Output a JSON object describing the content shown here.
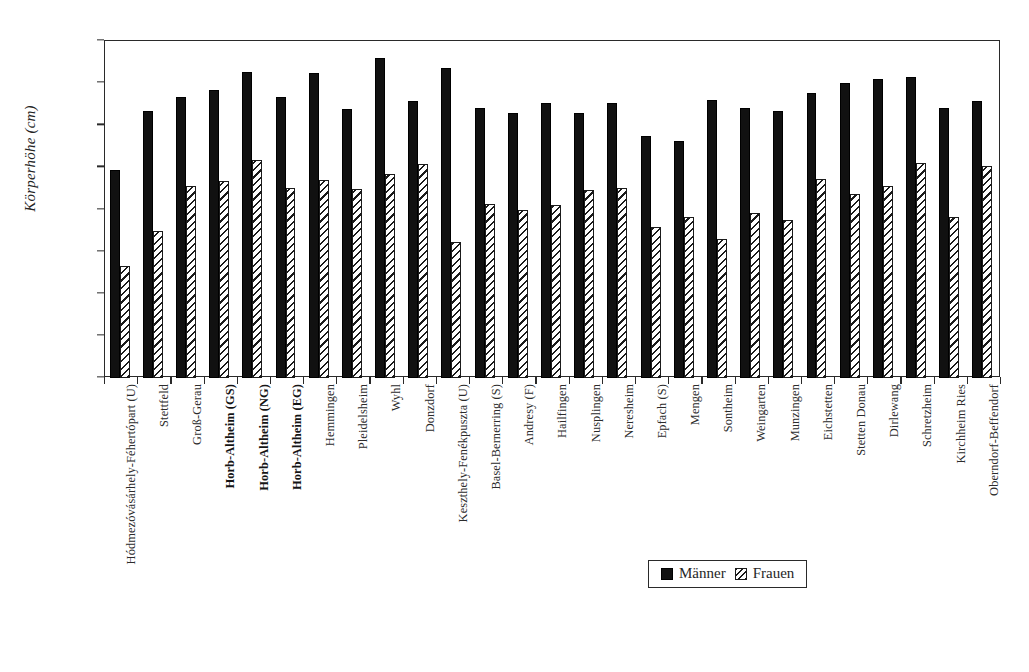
{
  "chart_data": {
    "type": "bar",
    "title": "",
    "xlabel": "",
    "ylabel": "Körperhöhe (cm)",
    "ylim": [
      140,
      180
    ],
    "ytick_step": 5,
    "yticks": [
      180,
      175,
      170,
      165,
      160,
      155,
      150,
      145,
      140
    ],
    "grid": false,
    "legend_position": "bottom-right",
    "categories": [
      "Hódmezóvásárhely-Féhertópart (U)",
      "Stettfeld",
      "Groß-Gerau",
      "Horb-Altheim (GS)",
      "Horb-Altheim (NG)",
      "Horb-Altheim (EG)",
      "Hemmingen",
      "Pleidelsheim",
      "Wyhl",
      "Donzdorf",
      "Keszthely-Fenékpuszta (U)",
      "Basel-Bernerring (S)",
      "Andresy (F)",
      "Hailfingen",
      "Nusplingen",
      "Neresheim",
      "Epfach (S)",
      "Mengen",
      "Sontheim",
      "Weingarten",
      "Munzingen",
      "Eichstetten",
      "Stetten Donau",
      "Dirlewang",
      "Schretzheim",
      "Kirchheim Ries",
      "Oberndorf-Beffendorf"
    ],
    "categories_bold": [
      "Horb-Altheim (GS)",
      "Horb-Altheim (NG)",
      "Horb-Altheim (EG)"
    ],
    "series": [
      {
        "name": "Männer",
        "style": "solid-black",
        "color": "#111111",
        "values": [
          164.7,
          171.7,
          173.3,
          174.2,
          176.3,
          173.3,
          176.2,
          171.9,
          178.0,
          172.9,
          176.8,
          172.0,
          171.4,
          172.6,
          171.5,
          172.6,
          168.7,
          168.1,
          173.0,
          172.1,
          171.7,
          173.8,
          175.0,
          175.5,
          175.7,
          172.1,
          172.9
        ]
      },
      {
        "name": "Frauen",
        "style": "diagonal-hatch",
        "color": "#ffffff",
        "values": [
          153.3,
          157.4,
          162.8,
          163.4,
          165.9,
          162.6,
          163.5,
          162.4,
          164.2,
          165.4,
          156.1,
          160.7,
          159.9,
          160.5,
          162.3,
          162.5,
          157.9,
          159.1,
          156.5,
          159.6,
          158.8,
          163.6,
          161.8,
          162.8,
          165.5,
          159.1,
          165.2
        ]
      }
    ]
  },
  "legend": {
    "items": [
      {
        "label": "Männer",
        "swatch": "solid-black-square"
      },
      {
        "label": "Frauen",
        "swatch": "hatched-square"
      }
    ]
  }
}
